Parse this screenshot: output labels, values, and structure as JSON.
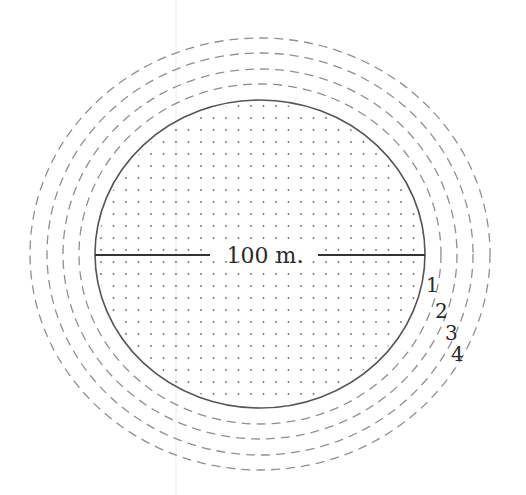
{
  "diagram": {
    "center": {
      "x": 260,
      "y": 254
    },
    "field": {
      "rx": 165,
      "ry": 154,
      "stroke": "#555555",
      "dot_color": "#6e6e6e",
      "dot_spacing_x": 12.5,
      "dot_spacing_y": 12
    },
    "diameter": {
      "label": "100 m.",
      "line_color": "#333333",
      "left_start": 95,
      "left_end": 210,
      "right_start": 318,
      "right_end": 425,
      "y": 255
    },
    "rings": [
      {
        "label": "1",
        "rx": 181,
        "ry": 170,
        "label_x": 426,
        "label_y": 292
      },
      {
        "label": "2",
        "rx": 197,
        "ry": 185,
        "label_x": 435,
        "label_y": 318
      },
      {
        "label": "3",
        "rx": 213,
        "ry": 201,
        "label_x": 445,
        "label_y": 340
      },
      {
        "label": "4",
        "rx": 230,
        "ry": 216,
        "label_x": 451,
        "label_y": 361
      }
    ],
    "ring_style": {
      "stroke": "#8f8f8f",
      "dash": "9 6"
    }
  }
}
